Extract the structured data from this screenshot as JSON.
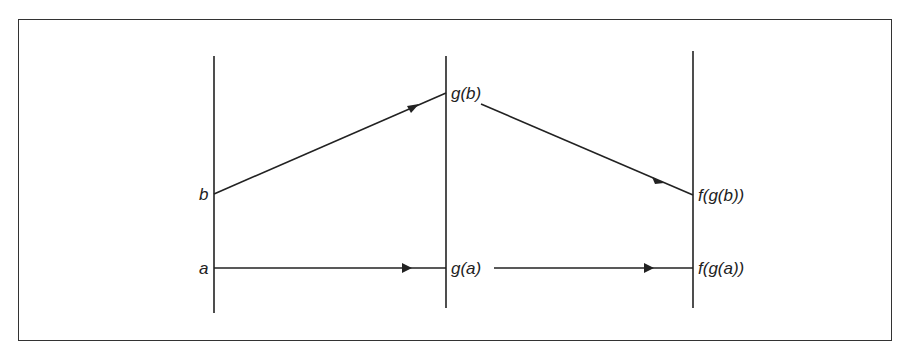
{
  "figure": {
    "axes": [
      "domain",
      "g-image",
      "f-image"
    ],
    "labels": {
      "b": "b",
      "a": "a",
      "gb": "g(b)",
      "ga": "g(a)",
      "fgb": "f(g(b))",
      "fga": "f(g(a))"
    },
    "mappings": [
      {
        "from": "b",
        "to": "g(b)",
        "function": "g"
      },
      {
        "from": "g(b)",
        "to": "f(g(b))",
        "function": "f"
      },
      {
        "from": "a",
        "to": "g(a)",
        "function": "g"
      },
      {
        "from": "g(a)",
        "to": "f(g(a))",
        "function": "f"
      }
    ]
  }
}
